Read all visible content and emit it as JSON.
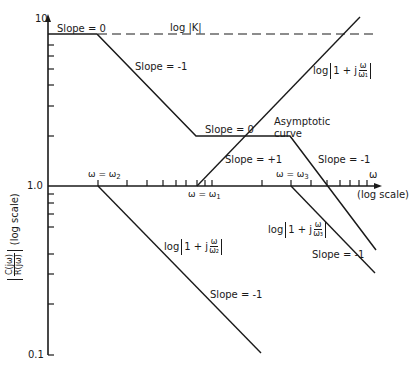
{
  "diagram": {
    "y_axis": {
      "label_frac_num": "C(jω)",
      "label_frac_den": "R(jω)",
      "label_scale": "(log scale)",
      "ticks": [
        "10",
        "1.0",
        "0.1"
      ]
    },
    "x_axis": {
      "symbol": "ω",
      "label_scale": "(log scale)",
      "markers": {
        "w1": "ω = ω",
        "w1_sub": "1",
        "w2": "ω = ω",
        "w2_sub": "2",
        "w3": "ω = ω",
        "w3_sub": "3"
      }
    },
    "labels": {
      "log_k": "log |K|",
      "slope_0_top": "Slope = 0",
      "slope_m1_upper": "Slope = -1",
      "slope_0_mid": "Slope = 0",
      "slope_p1": "Slope = +1",
      "slope_m1_right": "Slope = -1",
      "asymptotic_curve_line1": "Asymptotic",
      "asymptotic_curve_line2": "curve",
      "slope_m1_w3": "Slope = -1",
      "slope_m1_w2": "Slope = -1",
      "term_w1_prefix": "log",
      "term_w1_inner": "1 + j",
      "term_w1_num": "ω",
      "term_w1_den": "ω₁",
      "term_w2_prefix": "log",
      "term_w2_inner": "1 + j",
      "term_w2_num": "ω",
      "term_w2_den": "ω₂",
      "term_w3_prefix": "log",
      "term_w3_inner": "1 + j",
      "term_w3_num": "ω",
      "term_w3_den": "ω₃"
    },
    "colors": {
      "ink": "#1a1a1a",
      "background": "#ffffff"
    }
  }
}
